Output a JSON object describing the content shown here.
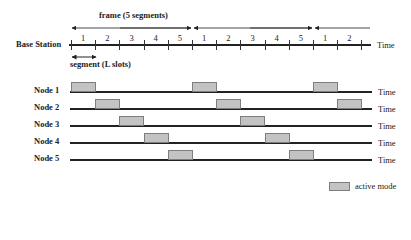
{
  "diagram": {
    "frame_label": "frame (5 segments)",
    "segment_label": "segment (L slots)",
    "base_station": {
      "label": "Base Station",
      "axis_label": "Time",
      "segment_numbers": [
        "1",
        "2",
        "3",
        "4",
        "5",
        "1",
        "2",
        "3",
        "4",
        "5",
        "1",
        "2"
      ]
    },
    "nodes": [
      {
        "label": "Node 1",
        "axis_label": "Time",
        "active_segments": [
          0,
          5,
          10
        ]
      },
      {
        "label": "Node 2",
        "axis_label": "Time",
        "active_segments": [
          1,
          6,
          11
        ]
      },
      {
        "label": "Node 3",
        "axis_label": "Time",
        "active_segments": [
          2,
          7
        ]
      },
      {
        "label": "Node 4",
        "axis_label": "Time",
        "active_segments": [
          3,
          8
        ]
      },
      {
        "label": "Node 5",
        "axis_label": "Time",
        "active_segments": [
          4,
          9
        ]
      }
    ],
    "legend": {
      "label": "active mode"
    },
    "colors": {
      "active_fill": "#c3c3c3",
      "active_border": "#7e7e7e",
      "line": "#222222"
    }
  }
}
